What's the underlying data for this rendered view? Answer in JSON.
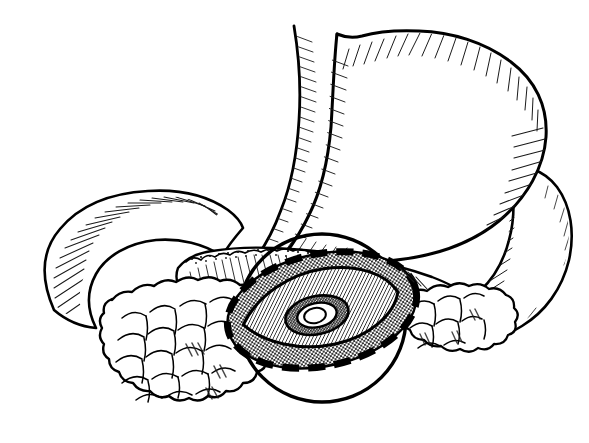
{
  "figure": {
    "title": "Pancreatic lesion with dashed resection margin",
    "subtitle": "Stomach, duodenum and pancreas line drawing",
    "style": "black-and-white pen-and-ink medical illustration",
    "background_color": "#ffffff",
    "ink_color": "#000000",
    "canvas": {
      "width": 589,
      "height": 443
    }
  },
  "structures": [
    {
      "id": "stomach",
      "label": "Stomach",
      "description": "Large J-shaped organ occupying the upper right of the figure, shaded with fine hatching along the greater and lesser curvatures",
      "shading": "hatched",
      "fill_color": "#ffffff"
    },
    {
      "id": "esophagus",
      "label": "Esophagus / cardia",
      "description": "Narrow tube entering the stomach at the top, with a notch at the cardiac incisure",
      "shading": "hatched",
      "fill_color": "#ffffff"
    },
    {
      "id": "duodenum",
      "label": "Duodenum",
      "description": "C-shaped loop sweeping from the upper left down and around the pancreatic head",
      "shading": "hatched",
      "fill_color": "#ffffff"
    },
    {
      "id": "duodenum-distal",
      "label": "Distal duodenum",
      "description": "Lobe-like segment at the right margin of the figure behind the stomach",
      "shading": "hatched",
      "fill_color": "#ffffff"
    },
    {
      "id": "pancreas-body",
      "label": "Pancreas body and tail",
      "description": "Elongated gland running horizontally across the middle with a scalloped stippled superior border",
      "shading": "stippled-and-hatched",
      "fill_color": "#ffffff"
    },
    {
      "id": "pancreas-head",
      "label": "Pancreatic head (lobulated)",
      "description": "Cobblestone cluster of rounded lobules at the lower left",
      "shading": "lobulated",
      "fill_color": "#ffffff"
    },
    {
      "id": "pancreas-tail-lobules",
      "label": "Pancreatic tail lobules",
      "description": "Smaller cluster of rounded lobules to the right of the lesion",
      "shading": "lobulated",
      "fill_color": "#ffffff"
    },
    {
      "id": "wall-circle",
      "label": "Bowel wall circumference",
      "description": "Heavy circular outline framing the lesion from below",
      "shading": "outline-only",
      "fill_color": "#ffffff"
    }
  ],
  "lesion": {
    "label": "Central lesion",
    "description": "Oval mass with concentric zones, shown in cut-away view",
    "zones": [
      {
        "id": "resection-margin",
        "label": "Dashed resection margin",
        "pattern": "thick black dashes",
        "note": "follows the outer oval boundary"
      },
      {
        "id": "outer-rim",
        "label": "Outer stippled rim",
        "pattern": "dotted stipple",
        "tone": "medium gray"
      },
      {
        "id": "inner-lens",
        "label": "Inner hatched lens",
        "pattern": "fine diagonal hatching",
        "tone": "dark gray"
      },
      {
        "id": "crater-ring",
        "label": "Crater ring",
        "pattern": "dense stipple ring",
        "tone": "dark"
      },
      {
        "id": "crater-core",
        "label": "Central crater",
        "pattern": "solid white",
        "tone": "white"
      }
    ]
  },
  "annotations": {
    "visible_text": [],
    "note": "No labels, captions, scale bars or legends appear in this image"
  }
}
